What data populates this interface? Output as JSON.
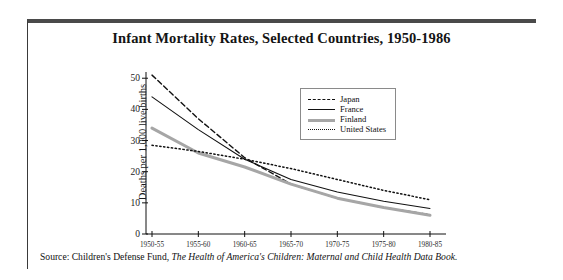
{
  "figure": {
    "title": "Infant Mortality Rates, Selected Countries, 1950-1986",
    "source_prefix": "Source: Children's Defense Fund,",
    "source_italic": "The Health of America's Children: Maternal and Child Health Data Book."
  },
  "legend": {
    "position": "inside-top-right",
    "entries": [
      {
        "label": "Japan",
        "style": "dashed",
        "color": "#111111"
      },
      {
        "label": "France",
        "style": "solid",
        "color": "#111111"
      },
      {
        "label": "Finland",
        "style": "solid-thick",
        "color": "#a6a6a6"
      },
      {
        "label": "United States",
        "style": "dotted",
        "color": "#111111"
      }
    ]
  },
  "chart_data": {
    "type": "line",
    "title": "Infant Mortality Rates, Selected Countries, 1950-1986",
    "xlabel": "",
    "ylabel": "Deaths per 1,000 live births",
    "categories": [
      "1950-55",
      "1955-60",
      "1960-65",
      "1965-70",
      "1970-75",
      "1975-80",
      "1980-85"
    ],
    "yticks": [
      0,
      10,
      20,
      30,
      40,
      50
    ],
    "ylim": [
      0,
      52
    ],
    "grid": false,
    "series": [
      {
        "name": "Japan",
        "color": "#111111",
        "style": "dashed",
        "values": [
          51.0,
          37.0,
          24.5,
          16.0,
          11.5,
          8.5,
          6.2
        ]
      },
      {
        "name": "France",
        "color": "#111111",
        "style": "solid",
        "values": [
          44.0,
          33.5,
          24.0,
          17.5,
          13.5,
          10.5,
          8.2
        ]
      },
      {
        "name": "Finland",
        "color": "#a6a6a6",
        "style": "solid-thick",
        "values": [
          34.0,
          26.0,
          21.5,
          16.0,
          11.5,
          8.5,
          6.0
        ]
      },
      {
        "name": "United States",
        "color": "#111111",
        "style": "dotted",
        "values": [
          28.5,
          26.5,
          24.0,
          21.0,
          17.5,
          14.0,
          11.0
        ]
      }
    ]
  }
}
